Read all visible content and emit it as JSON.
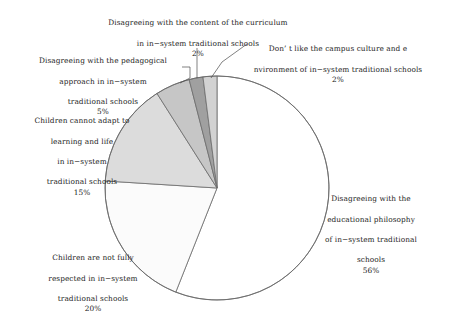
{
  "chart_data": {
    "type": "pie",
    "title": "",
    "legend_position": "callout-labels",
    "total": 100,
    "units": "percent",
    "categories": [
      "Disagreeing with the educational philosophy of in-system traditional schools",
      "Children are not fully respected in in-system traditional schools",
      "Children cannot adapt to learning and life in in-system traditional schools",
      "Disagreeing with the pedagogical approach in in-system traditional schools",
      "Disagreeing with the content of the curriculum in in-system traditional schools",
      "Don' t like the campus culture and e nvironment of in-system traditional schools"
    ],
    "values": [
      56,
      20,
      15,
      5,
      2,
      2
    ],
    "colors": [
      "#ffffff",
      "#fbfbfb",
      "#dcdcdc",
      "#c6c6c6",
      "#a0a0a0",
      "#d2d2d2"
    ],
    "slice_order_clockwise_from_top": [
      "Disagreeing with the educational philosophy of in-system traditional schools",
      "Children are not fully respected in in-system traditional schools",
      "Children cannot adapt to learning and life in in-system traditional schools",
      "Disagreeing with the pedagogical approach in in-system traditional schools",
      "Disagreeing with the content of the curriculum in in-system traditional schools",
      "Don' t like the campus culture and e nvironment of in-system traditional schools"
    ]
  },
  "labels": {
    "curriculum": {
      "line1": "Disagreeing with the content of the curriculum",
      "line2": "in in−system traditional schools",
      "pct": "2%"
    },
    "campus": {
      "line1": "Don’ t like the campus culture and e",
      "line2": "nvironment of in−system traditional schools",
      "pct": "2%"
    },
    "pedagogical": {
      "line1": "Disagreeing with the pedagogical",
      "line2": "approach in in−system",
      "line3": "traditional schools",
      "pct": "5%"
    },
    "adapt": {
      "line1": "Children cannot adapt to",
      "line2": "learning and life",
      "line3": "in in−system",
      "line4": "traditional schools",
      "pct": "15%"
    },
    "respected": {
      "line1": "Children are not fully",
      "line2": "respected in in−system",
      "line3": "traditional schools",
      "pct": "20%"
    },
    "philosophy": {
      "line1": "Disagreeing with the",
      "line2": "educational philosophy",
      "line3": "of in−system traditional",
      "line4": "schools",
      "pct": "56%"
    }
  }
}
